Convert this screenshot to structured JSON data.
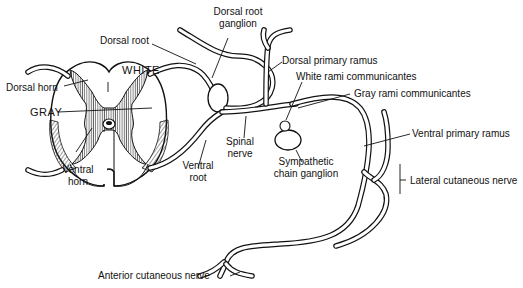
{
  "figure": {
    "colors": {
      "ink": "#111111",
      "background": "#ffffff"
    }
  },
  "labels": {
    "dorsal_root_ganglion": [
      "Dorsal root",
      "ganglion"
    ],
    "dorsal_root": "Dorsal root",
    "white": "WHITE",
    "dorsal_horn": "Dorsal horn",
    "gray": "GRAY",
    "dorsal_primary_ramus": "Dorsal primary ramus",
    "white_rami": "White rami communicantes",
    "gray_rami": "Gray rami communicantes",
    "spinal_nerve": [
      "Spinal",
      "nerve"
    ],
    "ventral_horn": [
      "Ventral",
      "horn"
    ],
    "ventral_root": [
      "Ventral",
      "root"
    ],
    "sympathetic_chain_ganglion": [
      "Sympathetic",
      "chain ganglion"
    ],
    "ventral_primary_ramus": "Ventral primary ramus",
    "lateral_cutaneous_nerve": "Lateral cutaneous nerve",
    "anterior_cutaneous_nerve": "Anterior cutaneous nerve"
  }
}
